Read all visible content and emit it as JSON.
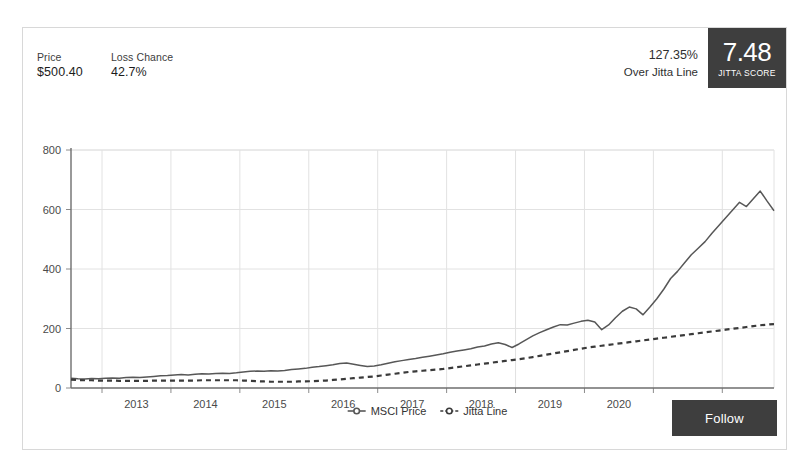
{
  "header": {
    "stats": [
      {
        "label": "Price",
        "value": "$500.40",
        "name": "price"
      },
      {
        "label": "Loss Chance",
        "value": "42.7%",
        "name": "loss-chance"
      }
    ],
    "over_jitta_percent": "127.35%",
    "over_jitta_caption": "Over Jitta Line",
    "score_value": "7.48",
    "score_caption": "JITTA SCORE"
  },
  "actions": {
    "follow_label": "Follow"
  },
  "colors": {
    "score_box_bg": "#3e3e3e",
    "follow_bg": "#3e3e3e",
    "price_line": "#575757",
    "jitta_line": "#3a3a3a",
    "grid": "#e2e2e2",
    "axis": "#8c8c8c",
    "card_border": "#d8d8d8"
  },
  "chart_data": {
    "type": "line",
    "title": "",
    "xlabel": "",
    "ylabel": "",
    "grid": true,
    "legend_position": "bottom",
    "ylim": [
      0,
      800
    ],
    "yticks": [
      0,
      200,
      400,
      600,
      800
    ],
    "xticks": [
      "2013",
      "2014",
      "2015",
      "2016",
      "2017",
      "2018",
      "2019",
      "2020",
      "2021",
      "2022"
    ],
    "xlim": [
      2012.55,
      2022.75
    ],
    "x": [
      2012.55,
      2012.65,
      2012.75,
      2012.85,
      2012.95,
      2013.05,
      2013.15,
      2013.25,
      2013.35,
      2013.45,
      2013.55,
      2013.65,
      2013.75,
      2013.85,
      2013.95,
      2014.05,
      2014.15,
      2014.25,
      2014.35,
      2014.45,
      2014.55,
      2014.65,
      2014.75,
      2014.85,
      2014.95,
      2015.05,
      2015.15,
      2015.25,
      2015.35,
      2015.45,
      2015.55,
      2015.65,
      2015.75,
      2015.85,
      2015.95,
      2016.05,
      2016.15,
      2016.25,
      2016.35,
      2016.45,
      2016.55,
      2016.65,
      2016.75,
      2016.85,
      2016.95,
      2017.05,
      2017.15,
      2017.25,
      2017.35,
      2017.45,
      2017.55,
      2017.65,
      2017.75,
      2017.85,
      2017.95,
      2018.05,
      2018.15,
      2018.25,
      2018.35,
      2018.45,
      2018.55,
      2018.65,
      2018.75,
      2018.85,
      2018.95,
      2019.05,
      2019.15,
      2019.25,
      2019.35,
      2019.45,
      2019.55,
      2019.65,
      2019.75,
      2019.85,
      2019.95,
      2020.05,
      2020.15,
      2020.25,
      2020.35,
      2020.45,
      2020.55,
      2020.65,
      2020.75,
      2020.85,
      2020.95,
      2021.05,
      2021.15,
      2021.25,
      2021.35,
      2021.45,
      2021.55,
      2021.65,
      2021.75,
      2021.85,
      2021.95,
      2022.05,
      2022.15,
      2022.25,
      2022.35,
      2022.45,
      2022.55,
      2022.65,
      2022.75
    ],
    "series": [
      {
        "name": "MSCI Price",
        "style": "solid",
        "color": "#575757",
        "values": [
          33,
          31,
          30,
          32,
          31,
          33,
          34,
          33,
          35,
          36,
          35,
          37,
          39,
          41,
          42,
          44,
          45,
          44,
          46,
          48,
          47,
          49,
          50,
          49,
          51,
          54,
          56,
          57,
          56,
          58,
          57,
          59,
          62,
          64,
          66,
          70,
          72,
          75,
          78,
          82,
          84,
          80,
          76,
          72,
          74,
          78,
          83,
          88,
          92,
          96,
          99,
          103,
          107,
          111,
          115,
          120,
          124,
          128,
          132,
          138,
          141,
          148,
          152,
          146,
          136,
          148,
          162,
          175,
          186,
          196,
          205,
          213,
          212,
          218,
          224,
          228,
          222,
          196,
          212,
          236,
          258,
          272,
          266,
          246,
          272,
          300,
          332,
          368,
          392,
          420,
          448,
          470,
          492,
          520,
          546,
          572,
          598,
          624,
          610,
          636,
          662,
          628,
          596
        ]
      },
      {
        "name": "Jitta Line",
        "style": "dashed",
        "color": "#3a3a3a",
        "values": [
          28,
          27,
          26,
          26,
          25,
          25,
          25,
          24,
          24,
          24,
          24,
          24,
          25,
          25,
          25,
          25,
          25,
          25,
          25,
          26,
          26,
          26,
          26,
          26,
          26,
          25,
          24,
          23,
          22,
          21,
          21,
          21,
          21,
          22,
          22,
          23,
          24,
          25,
          27,
          29,
          31,
          33,
          35,
          37,
          39,
          42,
          45,
          48,
          51,
          54,
          56,
          58,
          60,
          62,
          64,
          67,
          70,
          73,
          76,
          79,
          82,
          85,
          88,
          91,
          94,
          97,
          100,
          104,
          108,
          112,
          116,
          120,
          124,
          128,
          132,
          136,
          139,
          142,
          145,
          148,
          151,
          154,
          157,
          160,
          163,
          166,
          169,
          172,
          175,
          178,
          181,
          184,
          187,
          190,
          193,
          196,
          199,
          202,
          205,
          208,
          211,
          213,
          215
        ]
      }
    ],
    "legend": [
      {
        "label": "MSCI Price",
        "marker": "circle-line",
        "style": "solid"
      },
      {
        "label": "Jitta Line",
        "marker": "circle-line",
        "style": "dashed"
      }
    ]
  }
}
